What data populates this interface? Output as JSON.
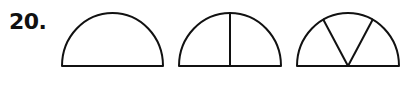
{
  "problem": {
    "number": "20."
  },
  "figures": [
    {
      "id": "semicircle-undivided",
      "shape": "semicircle",
      "parts": 1,
      "divider_lines": 0
    },
    {
      "id": "semicircle-halves",
      "shape": "semicircle",
      "parts": 2,
      "divider_lines": 1
    },
    {
      "id": "semicircle-thirds",
      "shape": "semicircle",
      "parts": 3,
      "divider_lines": 2
    }
  ],
  "style": {
    "stroke_color": "#111111",
    "background": "#ffffff"
  }
}
